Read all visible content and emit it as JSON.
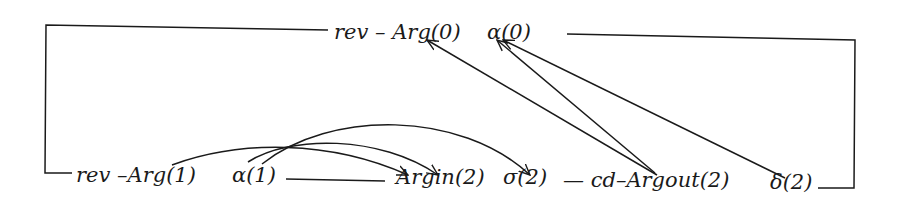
{
  "diagram": {
    "type": "dependency-graph",
    "stroke_color": "#1a1a1a",
    "background": "#ffffff",
    "nodes": {
      "top": {
        "rev_arg0": "rev – Arg(0)",
        "alpha0": "α(0)"
      },
      "bottom": {
        "rev_arg1": "rev –Arg(1)",
        "alpha1": "α(1)",
        "argin2": "Argin(2)",
        "sigma2": "σ(2)",
        "cd_argout2": "— cd–Argout(2)",
        "delta2": "δ(2)"
      }
    },
    "edges": [
      {
        "from": "Arg(1)",
        "to": "Argin(2)",
        "kind": "arc"
      },
      {
        "from": "α(1)",
        "to": "Argin(2)",
        "kind": "arc"
      },
      {
        "from": "α(1)",
        "to": "σ(2)",
        "kind": "arc"
      },
      {
        "from": "Argout(2)",
        "to": "Arg(0)",
        "kind": "straight"
      },
      {
        "from": "Argout(2)",
        "to": "α(0)",
        "kind": "straight"
      },
      {
        "from": "δ(2)",
        "to": "α(0)",
        "kind": "straight"
      }
    ],
    "frame": "Top row and bottom row joined by a bracket connector on left and right"
  }
}
